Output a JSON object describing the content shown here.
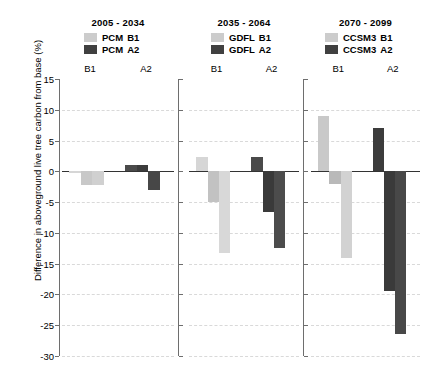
{
  "chart_data": {
    "type": "bar",
    "title": "",
    "xlabel": "",
    "ylabel": "Difference in aboveground live tree carbon from base (%)",
    "ylim": [
      -30,
      15
    ],
    "ytick_labels": [
      "15",
      "10",
      "5",
      "0",
      "-5",
      "-10",
      "-15",
      "-20",
      "-25",
      "-30"
    ],
    "ytick_values": [
      15,
      10,
      5,
      0,
      -5,
      -10,
      -15,
      -20,
      -25,
      -30
    ],
    "grid": true,
    "legend_position": "above-each-panel",
    "panels": [
      {
        "title": "2005 - 2034",
        "model": "PCM",
        "legend": [
          {
            "label_model": "PCM",
            "label_scenario": "B1",
            "color": "#cccccc"
          },
          {
            "label_model": "PCM",
            "label_scenario": "A2",
            "color": "#404040"
          }
        ],
        "groups": [
          {
            "label": "B1",
            "color": "#cccccc",
            "values": [
              -0.2,
              -2.2,
              -2.2
            ],
            "shades": [
              "#d6d6d6",
              "#c8c8c8",
              "#d0d0d0"
            ]
          },
          {
            "label": "A2",
            "color": "#404040",
            "values": [
              1.0,
              1.0,
              -3.1
            ],
            "shades": [
              "#4a4a4a",
              "#3c3c3c",
              "#474747"
            ]
          }
        ]
      },
      {
        "title": "2035 - 2064",
        "model": "GDFL",
        "legend": [
          {
            "label_model": "GDFL",
            "label_scenario": "B1",
            "color": "#cccccc"
          },
          {
            "label_model": "GDFL",
            "label_scenario": "A2",
            "color": "#404040"
          }
        ],
        "groups": [
          {
            "label": "B1",
            "color": "#cccccc",
            "values": [
              2.4,
              -5.0,
              -13.2
            ],
            "shades": [
              "#d6d6d6",
              "#c2c2c2",
              "#d8d8d8"
            ]
          },
          {
            "label": "A2",
            "color": "#404040",
            "values": [
              2.4,
              -6.6,
              -12.4
            ],
            "shades": [
              "#4a4a4a",
              "#3a3a3a",
              "#4c4c4c"
            ]
          }
        ]
      },
      {
        "title": "2070 - 2099",
        "model": "CCSM3",
        "legend": [
          {
            "label_model": "CCSM3",
            "label_scenario": "B1",
            "color": "#cccccc"
          },
          {
            "label_model": "CCSM3",
            "label_scenario": "A2",
            "color": "#404040"
          }
        ],
        "groups": [
          {
            "label": "B1",
            "color": "#cccccc",
            "values": [
              9.0,
              -2.0,
              -14.0
            ],
            "shades": [
              "#c9c9c9",
              "#b9b9b9",
              "#d2d2d2"
            ]
          },
          {
            "label": "A2",
            "color": "#404040",
            "values": [
              7.0,
              -19.5,
              -26.4
            ],
            "shades": [
              "#3c3c3c",
              "#3a3a3a",
              "#484848"
            ]
          }
        ]
      }
    ]
  }
}
